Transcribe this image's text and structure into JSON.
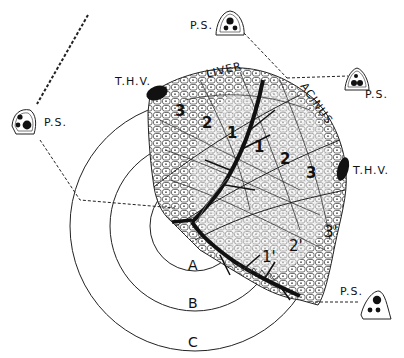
{
  "diagram": {
    "title_words": {
      "liver": "LIVER",
      "acinus": "ACINUS"
    },
    "portal_spaces": [
      {
        "id": "ps-left",
        "label": "P.S."
      },
      {
        "id": "ps-top",
        "label": "P.S."
      },
      {
        "id": "ps-right",
        "label": "P.S."
      },
      {
        "id": "ps-bottom-right",
        "label": "P.S."
      }
    ],
    "hepatic_venules": [
      {
        "id": "thv-top-left",
        "label": "T.H.V."
      },
      {
        "id": "thv-right",
        "label": "T.H.V."
      }
    ],
    "zones": [
      {
        "id": "zone-3-upper",
        "label": "3"
      },
      {
        "id": "zone-2-upper",
        "label": "2"
      },
      {
        "id": "zone-1-upper-a",
        "label": "1"
      },
      {
        "id": "zone-1-upper-b",
        "label": "1"
      },
      {
        "id": "zone-2-right",
        "label": "2"
      },
      {
        "id": "zone-3-right",
        "label": "3"
      },
      {
        "id": "zone-1-prime",
        "label": "1'"
      },
      {
        "id": "zone-2-prime",
        "label": "2'"
      },
      {
        "id": "zone-3-prime",
        "label": "3'"
      }
    ],
    "rings": [
      {
        "id": "ring-a",
        "label": "A"
      },
      {
        "id": "ring-b",
        "label": "B"
      },
      {
        "id": "ring-c",
        "label": "C"
      }
    ],
    "colors": {
      "ink": "#111111",
      "paper": "#ffffff",
      "stipple": "#bdbdbd"
    }
  }
}
